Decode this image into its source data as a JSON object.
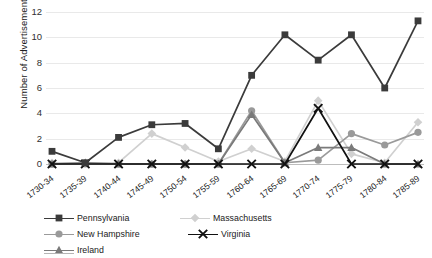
{
  "chart": {
    "ylabel": "Number of Advertisements",
    "xlabel": "",
    "title": ""
  },
  "chart_data": {
    "type": "line",
    "title": "",
    "xlabel": "",
    "ylabel": "Number of Advertisements",
    "ylim": [
      0,
      12
    ],
    "yticks": [
      0,
      2,
      4,
      6,
      8,
      10,
      12
    ],
    "grid": true,
    "legend_position": "bottom",
    "categories": [
      "1730-34",
      "1735-39",
      "1740-44",
      "1745-49",
      "1750-54",
      "1755-59",
      "1760-64",
      "1765-69",
      "1770-74",
      "1775-79",
      "1780-84",
      "1785-89"
    ],
    "series": [
      {
        "name": "Pennsylvania",
        "color": "#3b3b3b",
        "marker": "square",
        "values": [
          1.0,
          0.1,
          2.1,
          3.1,
          3.2,
          1.2,
          7.0,
          10.2,
          8.2,
          10.2,
          6.0,
          11.3
        ]
      },
      {
        "name": "Massachusetts",
        "color": "#d0d0d0",
        "marker": "diamond",
        "values": [
          0.1,
          0.1,
          0.1,
          2.4,
          1.3,
          0.2,
          1.2,
          0.2,
          5.0,
          0.8,
          0.1,
          3.3
        ]
      },
      {
        "name": "New Hampshire",
        "color": "#9a9a9a",
        "marker": "circle",
        "values": [
          0.0,
          0.0,
          0.0,
          0.0,
          0.0,
          0.0,
          4.2,
          0.1,
          0.3,
          2.4,
          1.5,
          2.5
        ]
      },
      {
        "name": "Virginia",
        "color": "#111111",
        "marker": "cross",
        "values": [
          0.0,
          0.0,
          0.0,
          0.0,
          0.0,
          0.0,
          0.0,
          0.0,
          4.4,
          0.0,
          0.0,
          0.0
        ]
      },
      {
        "name": "Ireland",
        "color": "#7a7a7a",
        "marker": "triangle",
        "values": [
          0.0,
          0.1,
          0.0,
          0.0,
          0.0,
          0.0,
          3.9,
          0.1,
          1.3,
          1.3,
          0.0,
          0.0
        ]
      }
    ]
  },
  "legend": {
    "items": [
      {
        "label": "Pennsylvania"
      },
      {
        "label": "Massachusetts"
      },
      {
        "label": "New Hampshire"
      },
      {
        "label": "Virginia"
      },
      {
        "label": "Ireland"
      }
    ]
  }
}
